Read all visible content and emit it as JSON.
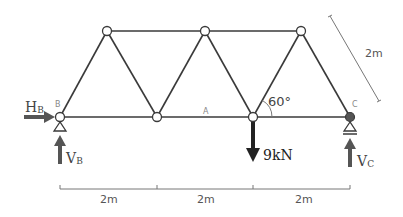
{
  "diagram": {
    "type": "truss",
    "nodes": {
      "B": {
        "label": "B",
        "support": "pin"
      },
      "A": {
        "label": "A"
      },
      "C": {
        "label": "C",
        "support": "roller"
      }
    },
    "reactions": {
      "HB": {
        "main": "H",
        "sub": "B"
      },
      "VB": {
        "main": "V",
        "sub": "B"
      },
      "VC": {
        "main": "V",
        "sub": "C"
      }
    },
    "load": {
      "label": "9kN",
      "direction": "down"
    },
    "angle": {
      "label": "60°"
    },
    "dimensions": {
      "member_length": "2m",
      "spans": [
        "2m",
        "2m",
        "2m"
      ]
    },
    "colors": {
      "member": "#3a3a3a",
      "arrow": "#555555",
      "load_arrow": "#222222",
      "dimension": "#777777"
    }
  }
}
